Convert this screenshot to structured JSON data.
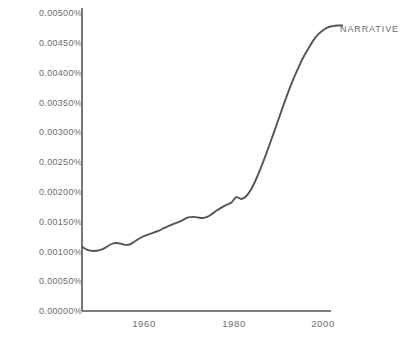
{
  "chart_data": {
    "type": "line",
    "title": "",
    "xlabel": "",
    "ylabel": "",
    "xlim": [
      1950,
      2005
    ],
    "ylim": [
      0.0,
      0.005
    ],
    "grid": false,
    "legend_position": "right-of-line-end",
    "y_tick_labels": [
      "0.00500%",
      "0.00450%",
      "0.00400%",
      "0.00350%",
      "0.00300%",
      "0.00250%",
      "0.00200%",
      "0.00150%",
      "0.00100%",
      "0.00050%",
      "0.00000%"
    ],
    "y_tick_values": [
      0.005,
      0.0045,
      0.004,
      0.0035,
      0.003,
      0.0025,
      0.002,
      0.0015,
      0.001,
      0.0005,
      0.0
    ],
    "x_tick_labels": [
      "1960",
      "1980",
      "2000"
    ],
    "x_tick_values": [
      1960,
      1980,
      2000
    ],
    "series": [
      {
        "name": "NARRATIVE",
        "color": "#555555",
        "x": [
          1950,
          1951,
          1952,
          1953,
          1954,
          1955,
          1956,
          1957,
          1958,
          1959,
          1960,
          1961,
          1962,
          1963,
          1964,
          1965,
          1966,
          1967,
          1968,
          1969,
          1970,
          1971,
          1972,
          1973,
          1974,
          1975,
          1976,
          1977,
          1978,
          1979,
          1980,
          1981,
          1982,
          1983,
          1984,
          1985,
          1986,
          1987,
          1988,
          1989,
          1990,
          1991,
          1992,
          1993,
          1994,
          1995,
          1996,
          1997,
          1998,
          1999,
          2000,
          2001,
          2002,
          2003,
          2004
        ],
        "values": [
          0.00108,
          0.00103,
          0.00101,
          0.00101,
          0.00103,
          0.00107,
          0.00112,
          0.00114,
          0.00113,
          0.00111,
          0.00112,
          0.00117,
          0.00122,
          0.00126,
          0.00129,
          0.00132,
          0.00135,
          0.00139,
          0.00143,
          0.00146,
          0.00149,
          0.00153,
          0.00157,
          0.00158,
          0.00157,
          0.00156,
          0.00158,
          0.00163,
          0.00169,
          0.00174,
          0.00178,
          0.00182,
          0.00191,
          0.00188,
          0.00192,
          0.00203,
          0.00219,
          0.00238,
          0.00259,
          0.00281,
          0.00304,
          0.00327,
          0.0035,
          0.00372,
          0.00392,
          0.0041,
          0.00427,
          0.00441,
          0.00454,
          0.00464,
          0.00471,
          0.00476,
          0.00478,
          0.00479,
          0.00479
        ]
      }
    ]
  },
  "axes": {
    "axis_color": "#555555",
    "tick_text_color": "#6b6b6b"
  }
}
